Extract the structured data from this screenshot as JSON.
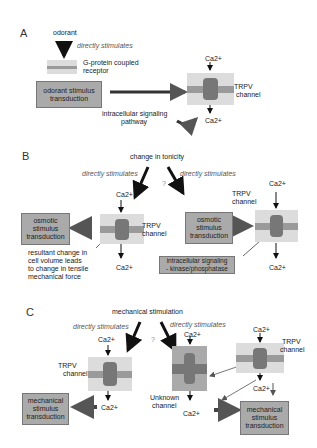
{
  "panelA": {
    "label": "A",
    "odorant": "odorant",
    "directly": "directly stimulates",
    "gpcr": [
      "G-protein coupled",
      "receptor"
    ],
    "box": [
      "odorant stimulus",
      "transduction"
    ],
    "ca_top": "Ca2+",
    "ca_bottom": "Ca2+",
    "trpv": [
      "TRPV",
      "channel"
    ],
    "pathway": [
      "intracellular signaling",
      "pathway"
    ]
  },
  "panelB": {
    "label": "B",
    "tonicity": "change in tonicity",
    "directly_left": "directly stimulates",
    "directly_right": "directly stimulates",
    "question": "?",
    "ca1_top": "Ca2+",
    "ca1_bottom": "Ca2+",
    "ca2_top": "Ca2+",
    "ca2_bottom": "Ca2+",
    "trpv1": [
      "TRPV",
      "channel"
    ],
    "trpv2": [
      "TRPV",
      "channel"
    ],
    "box1": [
      "osmotic",
      "stimulus",
      "transduction"
    ],
    "box2": [
      "osmotic",
      "stimulus",
      "transduction"
    ],
    "box3": [
      "intracellular signaling",
      "- kinase/phosphatase"
    ],
    "note": [
      "resultant change in",
      "cell volume leads",
      "to change in tensile",
      "mechanical force"
    ]
  },
  "panelC": {
    "label": "C",
    "mech": "mechanical stimulation",
    "directly_left": "directly stimulates",
    "directly_right": "directly stimulates",
    "question": "?",
    "trpv1": [
      "TRPV",
      "channel"
    ],
    "trpv2": [
      "TRPV",
      "channel"
    ],
    "unknown": [
      "Unknown",
      "channel"
    ],
    "ca1_top": "Ca2+",
    "ca1_bottom": "Ca2+",
    "ca2_top": "Ca2+",
    "ca2_bottom": "Ca2+",
    "ca3_top": "Ca2+",
    "ca3_bottom": "Ca2+",
    "box1": [
      "mechanical",
      "stimulus",
      "transduction"
    ],
    "box2": [
      "mechanical",
      "stimulus",
      "transduction"
    ]
  }
}
